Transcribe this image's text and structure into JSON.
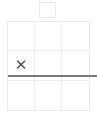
{
  "app": {
    "title": "Tic Tac Toe Board",
    "background_color": "#ffffff"
  },
  "top_widget": {
    "name": "empty-square-indicator",
    "label": "",
    "border_color": "#e9e9e9",
    "fill_color": "#ffffff"
  },
  "board": {
    "rows": 3,
    "columns": 3,
    "grid_line_color": "#efefef",
    "border_color": "#ececec",
    "cells": [
      {
        "row": 0,
        "col": 0,
        "mark": ""
      },
      {
        "row": 0,
        "col": 1,
        "mark": ""
      },
      {
        "row": 0,
        "col": 2,
        "mark": ""
      },
      {
        "row": 1,
        "col": 0,
        "mark": "✕"
      },
      {
        "row": 1,
        "col": 1,
        "mark": ""
      },
      {
        "row": 1,
        "col": 2,
        "mark": ""
      },
      {
        "row": 2,
        "col": 0,
        "mark": ""
      },
      {
        "row": 2,
        "col": 1,
        "mark": ""
      },
      {
        "row": 2,
        "col": 2,
        "mark": ""
      }
    ]
  },
  "strike_line": {
    "name": "horizontal-divider",
    "color": "#7a7a7a",
    "orientation": "horizontal"
  }
}
